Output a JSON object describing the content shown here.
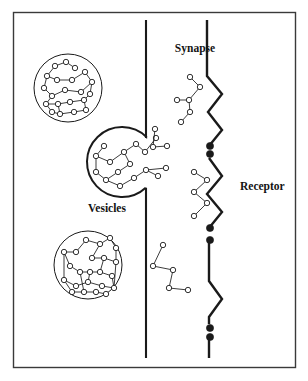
{
  "figure": {
    "background_color": "#ffffff",
    "border_color": "#3a3a3a",
    "ink_color": "#1a1a1a",
    "labels": {
      "synapse": "Synapse",
      "vesicles": "Vesicles",
      "receptor": "Receptor"
    },
    "label_positions": {
      "synapse": {
        "x": 195,
        "y": 52
      },
      "vesicles": {
        "x": 107,
        "y": 212
      },
      "receptor": {
        "x": 240,
        "y": 190
      }
    },
    "frame": {
      "x": 13,
      "y": 12,
      "width": 282,
      "height": 355
    },
    "membranes": {
      "presynaptic": {
        "name": "presynaptic-membrane",
        "x": 146,
        "y_top": 20,
        "y_bottom": 358,
        "gap_top": 138,
        "gap_bottom": 188
      },
      "postsynaptic": {
        "name": "postsynaptic-membrane",
        "x": 207,
        "y_top": 20,
        "y_bottom": 358
      }
    },
    "receptor_zigzags": [
      {
        "points": "207,20 207,76 222,94 208,112 222,130 209,146"
      },
      {
        "points": "209,158 222,176 207,194 222,212 209,228"
      },
      {
        "points": "209,240 209,281 222,299 209,317 209,324"
      }
    ],
    "bound_sites": [
      {
        "cx": 210,
        "cy": 146,
        "r": 3.6
      },
      {
        "cx": 210,
        "cy": 154,
        "r": 3.6
      },
      {
        "cx": 210,
        "cy": 228,
        "r": 3.6
      },
      {
        "cx": 210,
        "cy": 240,
        "r": 3.6
      },
      {
        "cx": 210,
        "cy": 328,
        "r": 3.6
      },
      {
        "cx": 210,
        "cy": 337,
        "r": 3.6
      }
    ],
    "vesicles": [
      {
        "name": "vesicle-top-left",
        "cx": 68,
        "cy": 88,
        "r": 34,
        "state": "intact",
        "nodes": [
          [
            55,
            66
          ],
          [
            66,
            62
          ],
          [
            75,
            68
          ],
          [
            47,
            76
          ],
          [
            57,
            80
          ],
          [
            72,
            80
          ],
          [
            85,
            72
          ],
          [
            92,
            82
          ],
          [
            81,
            92
          ],
          [
            65,
            90
          ],
          [
            52,
            96
          ],
          [
            44,
            88
          ],
          [
            46,
            104
          ],
          [
            58,
            104
          ],
          [
            70,
            102
          ],
          [
            84,
            100
          ],
          [
            90,
            94
          ],
          [
            60,
            114
          ],
          [
            74,
            112
          ],
          [
            86,
            110
          ],
          [
            52,
            112
          ]
        ],
        "edges": [
          [
            0,
            1
          ],
          [
            1,
            2
          ],
          [
            0,
            3
          ],
          [
            3,
            4
          ],
          [
            4,
            5
          ],
          [
            5,
            6
          ],
          [
            6,
            7
          ],
          [
            7,
            8
          ],
          [
            8,
            9
          ],
          [
            9,
            10
          ],
          [
            10,
            11
          ],
          [
            11,
            3
          ],
          [
            10,
            12
          ],
          [
            12,
            13
          ],
          [
            13,
            14
          ],
          [
            14,
            15
          ],
          [
            15,
            16
          ],
          [
            16,
            7
          ],
          [
            13,
            17
          ],
          [
            17,
            18
          ],
          [
            18,
            19
          ],
          [
            19,
            15
          ],
          [
            12,
            20
          ],
          [
            20,
            17
          ]
        ]
      },
      {
        "name": "vesicle-fusing",
        "cx": 122,
        "cy": 162,
        "r": 35,
        "state": "fusing",
        "nodes": [
          [
            104,
            146
          ],
          [
            96,
            156
          ],
          [
            110,
            162
          ],
          [
            124,
            152
          ],
          [
            136,
            144
          ],
          [
            145,
            152
          ],
          [
            156,
            138
          ],
          [
            130,
            164
          ],
          [
            118,
            172
          ],
          [
            106,
            180
          ],
          [
            120,
            186
          ],
          [
            134,
            178
          ],
          [
            146,
            170
          ],
          [
            158,
            176
          ],
          [
            166,
            168
          ],
          [
            96,
            172
          ]
        ],
        "edges": [
          [
            0,
            1
          ],
          [
            1,
            2
          ],
          [
            2,
            3
          ],
          [
            3,
            4
          ],
          [
            4,
            5
          ],
          [
            5,
            6
          ],
          [
            3,
            7
          ],
          [
            7,
            8
          ],
          [
            8,
            9
          ],
          [
            9,
            10
          ],
          [
            10,
            11
          ],
          [
            11,
            12
          ],
          [
            12,
            13
          ],
          [
            12,
            14
          ],
          [
            1,
            15
          ],
          [
            15,
            9
          ]
        ]
      },
      {
        "name": "vesicle-bottom-left",
        "cx": 88,
        "cy": 265,
        "r": 34,
        "state": "intact",
        "nodes": [
          [
            86,
            240
          ],
          [
            100,
            244
          ],
          [
            110,
            238
          ],
          [
            116,
            248
          ],
          [
            76,
            252
          ],
          [
            64,
            252
          ],
          [
            92,
            258
          ],
          [
            104,
            258
          ],
          [
            116,
            262
          ],
          [
            70,
            266
          ],
          [
            80,
            272
          ],
          [
            90,
            272
          ],
          [
            100,
            272
          ],
          [
            112,
            276
          ],
          [
            64,
            280
          ],
          [
            76,
            286
          ],
          [
            88,
            282
          ],
          [
            102,
            286
          ],
          [
            114,
            288
          ],
          [
            72,
            292
          ],
          [
            84,
            292
          ],
          [
            96,
            292
          ],
          [
            106,
            294
          ]
        ],
        "edges": [
          [
            0,
            1
          ],
          [
            1,
            2
          ],
          [
            2,
            3
          ],
          [
            0,
            4
          ],
          [
            4,
            5
          ],
          [
            5,
            9
          ],
          [
            1,
            6
          ],
          [
            6,
            7
          ],
          [
            7,
            8
          ],
          [
            3,
            8
          ],
          [
            9,
            10
          ],
          [
            10,
            11
          ],
          [
            11,
            12
          ],
          [
            12,
            13
          ],
          [
            5,
            14
          ],
          [
            14,
            15
          ],
          [
            15,
            16
          ],
          [
            16,
            17
          ],
          [
            17,
            18
          ],
          [
            8,
            18
          ],
          [
            14,
            19
          ],
          [
            19,
            20
          ],
          [
            20,
            21
          ],
          [
            21,
            22
          ],
          [
            11,
            16
          ],
          [
            7,
            12
          ],
          [
            13,
            18
          ],
          [
            20,
            10
          ]
        ]
      }
    ],
    "free_molecules": [
      {
        "name": "molecule-cleft-upper",
        "nodes": [
          [
            190,
            77
          ],
          [
            200,
            87
          ],
          [
            189,
            100
          ],
          [
            177,
            100
          ],
          [
            190,
            112
          ],
          [
            181,
            122
          ]
        ],
        "edges": [
          [
            0,
            1
          ],
          [
            1,
            2
          ],
          [
            2,
            3
          ],
          [
            2,
            4
          ],
          [
            4,
            5
          ]
        ]
      },
      {
        "name": "molecule-cleft-middle",
        "nodes": [
          [
            194,
            172
          ],
          [
            207,
            180
          ],
          [
            194,
            192
          ],
          [
            207,
            203
          ],
          [
            194,
            216
          ]
        ],
        "edges": [
          [
            0,
            1
          ],
          [
            1,
            2
          ],
          [
            2,
            3
          ],
          [
            3,
            4
          ]
        ]
      },
      {
        "name": "molecule-cleft-lower",
        "nodes": [
          [
            163,
            245
          ],
          [
            153,
            266
          ],
          [
            173,
            270
          ],
          [
            169,
            288
          ],
          [
            188,
            290
          ]
        ],
        "edges": [
          [
            0,
            1
          ],
          [
            1,
            2
          ],
          [
            2,
            3
          ],
          [
            3,
            4
          ]
        ]
      },
      {
        "name": "molecule-escaping-vesicle",
        "nodes": [
          [
            155,
            129
          ],
          [
            153,
            147
          ],
          [
            167,
            146
          ]
        ],
        "edges": [
          [
            0,
            1
          ],
          [
            1,
            2
          ]
        ]
      }
    ]
  }
}
